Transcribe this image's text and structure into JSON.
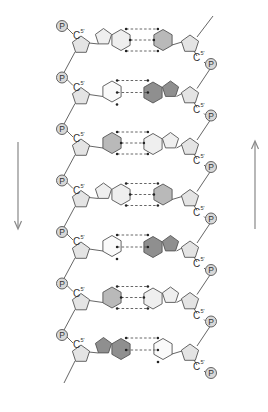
{
  "diagram": {
    "type": "dna-double-helix-schematic",
    "labels": {
      "phosphate": "P",
      "carbon5": "C",
      "carbon5_superscript": "5'"
    },
    "arrows": {
      "left": {
        "direction": "down"
      },
      "right": {
        "direction": "up"
      }
    },
    "colors": {
      "stroke": "#555555",
      "sugar_fill": "#e4e4e4",
      "phosphate_fill": "#d8d8d8",
      "pale_base_fill": "#efefef",
      "white_base_fill": "#fafafa",
      "medium_base_fill": "#b9b9b9",
      "dark_base_fill": "#8f8f8f",
      "arrow": "#888888"
    },
    "base_pairs": [
      {
        "row": 1,
        "left": "purine",
        "left_shade": "pale",
        "right": "pyrimidine",
        "right_shade": "medium",
        "hbonds": 3
      },
      {
        "row": 2,
        "left": "pyrimidine",
        "left_shade": "white",
        "right": "purine",
        "right_shade": "dark",
        "hbonds": 2
      },
      {
        "row": 3,
        "left": "pyrimidine",
        "left_shade": "medium",
        "right": "purine",
        "right_shade": "pale",
        "hbonds": 3
      },
      {
        "row": 4,
        "left": "purine",
        "left_shade": "pale",
        "right": "pyrimidine",
        "right_shade": "medium",
        "hbonds": 3
      },
      {
        "row": 5,
        "left": "pyrimidine",
        "left_shade": "white",
        "right": "purine",
        "right_shade": "dark",
        "hbonds": 2
      },
      {
        "row": 6,
        "left": "pyrimidine",
        "left_shade": "medium",
        "right": "purine",
        "right_shade": "pale",
        "hbonds": 3
      },
      {
        "row": 7,
        "left": "purine",
        "left_shade": "dark",
        "right": "pyrimidine",
        "right_shade": "white",
        "hbonds": 2
      }
    ]
  }
}
